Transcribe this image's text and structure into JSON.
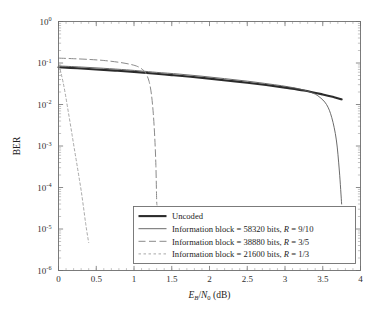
{
  "chart_data": {
    "type": "line",
    "title": "",
    "xlabel": "E_B/N_0 (dB)",
    "xlabel_parts": {
      "e": "E",
      "b": "B",
      "slash": "/",
      "n": "N",
      "zero": "0",
      "unit": " (dB)"
    },
    "ylabel": "BER",
    "xlim": [
      0,
      4
    ],
    "ylim": [
      1e-06,
      1
    ],
    "yscale": "log",
    "xscale": "linear",
    "grid": false,
    "legend_position": "lower right",
    "xticks": [
      "0",
      "0.5",
      "1",
      "1.5",
      "2",
      "2.5",
      "3",
      "3.5",
      "4"
    ],
    "xtick_values": [
      0,
      0.5,
      1,
      1.5,
      2,
      2.5,
      3,
      3.5,
      4
    ],
    "yticks": [
      {
        "mantissa": "10",
        "exponent": "0",
        "value": 1
      },
      {
        "mantissa": "10",
        "exponent": "-1",
        "value": 0.1
      },
      {
        "mantissa": "10",
        "exponent": "-2",
        "value": 0.01
      },
      {
        "mantissa": "10",
        "exponent": "-3",
        "value": 0.001
      },
      {
        "mantissa": "10",
        "exponent": "-4",
        "value": 0.0001
      },
      {
        "mantissa": "10",
        "exponent": "-5",
        "value": 1e-05
      },
      {
        "mantissa": "10",
        "exponent": "-6",
        "value": 1e-06
      }
    ],
    "series": [
      {
        "name": "Uncoded",
        "legend_label": "Uncoded",
        "style": "solid-thick",
        "color": "#2b2b2b",
        "width": 2.1,
        "dash": "",
        "points": [
          [
            0.0,
            0.079
          ],
          [
            0.25,
            0.0745
          ],
          [
            0.5,
            0.07
          ],
          [
            0.75,
            0.0655
          ],
          [
            1.0,
            0.061
          ],
          [
            1.25,
            0.056
          ],
          [
            1.5,
            0.051
          ],
          [
            1.75,
            0.0465
          ],
          [
            2.0,
            0.042
          ],
          [
            2.25,
            0.0375
          ],
          [
            2.5,
            0.0335
          ],
          [
            2.75,
            0.0295
          ],
          [
            3.0,
            0.0255
          ],
          [
            3.25,
            0.0218
          ],
          [
            3.5,
            0.0175
          ],
          [
            3.65,
            0.015
          ],
          [
            3.75,
            0.0133
          ]
        ]
      },
      {
        "name": "Information block = 58320 bits, R = 9/10",
        "legend_label_pre": "Information block = 58320 bits, ",
        "legend_label_r": "R",
        "legend_label_post": " = 9/10",
        "style": "solid-thin",
        "color": "#5a5a5a",
        "width": 0.9,
        "dash": "",
        "points": [
          [
            0.0,
            0.085
          ],
          [
            0.3,
            0.08
          ],
          [
            0.6,
            0.0745
          ],
          [
            0.9,
            0.0685
          ],
          [
            1.1,
            0.064
          ],
          [
            1.3,
            0.0595
          ],
          [
            1.6,
            0.054
          ],
          [
            1.9,
            0.048
          ],
          [
            2.2,
            0.042
          ],
          [
            2.5,
            0.0365
          ],
          [
            2.8,
            0.031
          ],
          [
            3.0,
            0.0275
          ],
          [
            3.2,
            0.0235
          ],
          [
            3.35,
            0.0195
          ],
          [
            3.45,
            0.0155
          ],
          [
            3.55,
            0.01
          ],
          [
            3.62,
            0.0048
          ],
          [
            3.68,
            0.0014
          ],
          [
            3.72,
            0.00025
          ],
          [
            3.75,
            4e-05
          ]
        ]
      },
      {
        "name": "Information block = 38880 bits, R = 3/5",
        "legend_label_pre": "Information block = 38880 bits, ",
        "legend_label_r": "R",
        "legend_label_post": " = 3/5",
        "style": "dashed",
        "color": "#8a8a8a",
        "width": 1.0,
        "dash": "7,3.5",
        "points": [
          [
            0.0,
            0.131
          ],
          [
            0.2,
            0.127
          ],
          [
            0.4,
            0.122
          ],
          [
            0.6,
            0.115
          ],
          [
            0.8,
            0.104
          ],
          [
            0.95,
            0.093
          ],
          [
            1.05,
            0.082
          ],
          [
            1.12,
            0.068
          ],
          [
            1.16,
            0.055
          ],
          [
            1.2,
            0.036
          ],
          [
            1.23,
            0.018
          ],
          [
            1.255,
            0.0062
          ],
          [
            1.275,
            0.0016
          ],
          [
            1.29,
            0.00034
          ],
          [
            1.3,
            5e-05
          ],
          [
            1.305,
            3.8e-05
          ]
        ]
      },
      {
        "name": "Information block = 21600 bits, R = 1/3",
        "legend_label_pre": "Information block = 21600 bits, ",
        "legend_label_r": "R",
        "legend_label_post": " = 1/3",
        "style": "dotted",
        "color": "#9e9e9e",
        "width": 0.9,
        "dash": "2.5,2.5",
        "points": [
          [
            0.005,
            0.09
          ],
          [
            0.03,
            0.06
          ],
          [
            0.06,
            0.035
          ],
          [
            0.09,
            0.018
          ],
          [
            0.12,
            0.0085
          ],
          [
            0.15,
            0.004
          ],
          [
            0.18,
            0.00185
          ],
          [
            0.21,
            0.00085
          ],
          [
            0.24,
            0.0004
          ],
          [
            0.27,
            0.000185
          ],
          [
            0.3,
            8.5e-05
          ],
          [
            0.33,
            3.45e-05
          ],
          [
            0.36,
            1.35e-05
          ],
          [
            0.385,
            6.8e-06
          ],
          [
            0.4,
            4.7e-06
          ]
        ]
      }
    ]
  },
  "legend": {
    "items": [
      {
        "label": "Uncoded",
        "style": "solid-thick"
      },
      {
        "label": "Information block = 58320 bits, R = 9/10",
        "style": "solid-thin"
      },
      {
        "label": "Information block = 38880 bits, R = 3/5",
        "style": "dashed"
      },
      {
        "label": "Information block = 21600 bits, R = 1/3",
        "style": "dotted"
      }
    ]
  },
  "colors": {
    "frame": "#6e6e6e",
    "text": "#2b2b2b",
    "background": "#ffffff"
  }
}
